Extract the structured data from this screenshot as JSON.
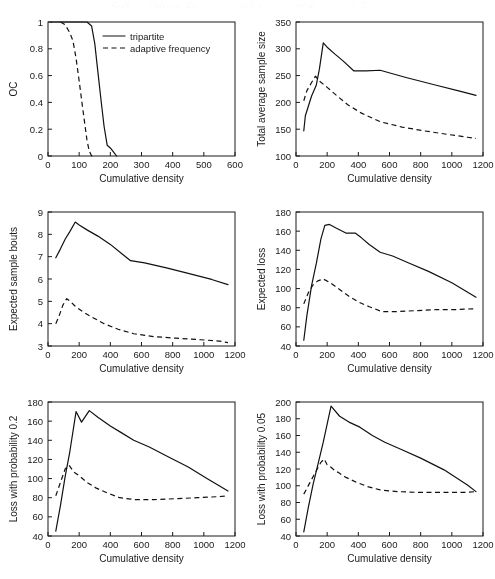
{
  "figure": {
    "title": "",
    "panel_count": 6,
    "legend": {
      "entries": [
        {
          "label": "tripartite",
          "style": "solid"
        },
        {
          "label": "adaptive frequency",
          "style": "dashed"
        }
      ]
    }
  },
  "chart_data": [
    {
      "id": "oc",
      "type": "line",
      "title": "",
      "xlabel": "Cumulative density",
      "ylabel": "OC",
      "xlim": [
        0,
        600
      ],
      "ylim": [
        0,
        1
      ],
      "xticks": [
        0,
        100,
        200,
        300,
        400,
        500,
        600
      ],
      "yticks": [
        0,
        0.2,
        0.4,
        0.6,
        0.8,
        1
      ],
      "ytick_labels": [
        "0",
        "0.2",
        "0.4",
        "0.6",
        "0.8",
        "1"
      ],
      "grid": false,
      "legend_position": "upper-center",
      "series": [
        {
          "name": "tripartite",
          "style": "solid",
          "x": [
            10,
            60,
            110,
            125,
            140,
            150,
            160,
            170,
            180,
            190,
            200,
            210,
            220
          ],
          "y": [
            1.0,
            1.0,
            1.0,
            1.0,
            0.97,
            0.84,
            0.63,
            0.42,
            0.22,
            0.08,
            0.06,
            0.03,
            0.0
          ]
        },
        {
          "name": "adaptive frequency",
          "style": "dashed",
          "x": [
            40,
            55,
            70,
            80,
            90,
            100,
            110,
            118,
            125,
            132,
            140,
            150
          ],
          "y": [
            1.0,
            0.98,
            0.92,
            0.86,
            0.73,
            0.56,
            0.38,
            0.24,
            0.12,
            0.04,
            0.0,
            0.0
          ]
        }
      ]
    },
    {
      "id": "total-average-sample-size",
      "type": "line",
      "title": "",
      "xlabel": "Cumulative density",
      "ylabel": "Total average sample size",
      "xlim": [
        0,
        1200
      ],
      "ylim": [
        100,
        350
      ],
      "xticks": [
        0,
        200,
        400,
        600,
        800,
        1000,
        1200
      ],
      "yticks": [
        100,
        150,
        200,
        250,
        300,
        350
      ],
      "grid": false,
      "series": [
        {
          "name": "tripartite",
          "style": "solid",
          "x": [
            50,
            60,
            100,
            130,
            150,
            175,
            200,
            250,
            300,
            370,
            450,
            540,
            700,
            900,
            1050,
            1155
          ],
          "y": [
            147,
            175,
            212,
            232,
            262,
            311,
            303,
            290,
            278,
            259,
            259,
            260,
            247,
            232,
            221,
            213
          ]
        },
        {
          "name": "adaptive frequency",
          "style": "dashed",
          "x": [
            50,
            70,
            100,
            125,
            150,
            200,
            260,
            330,
            420,
            540,
            680,
            820,
            980,
            1100,
            1155
          ],
          "y": [
            203,
            222,
            237,
            249,
            240,
            228,
            213,
            196,
            180,
            164,
            154,
            147,
            140,
            135,
            133
          ]
        }
      ]
    },
    {
      "id": "expected-sample-bouts",
      "type": "line",
      "title": "",
      "xlabel": "Cumulative density",
      "ylabel": "Expected sample bouts",
      "xlim": [
        0,
        1200
      ],
      "ylim": [
        3,
        9
      ],
      "xticks": [
        0,
        200,
        400,
        600,
        800,
        1000,
        1200
      ],
      "yticks": [
        3,
        4,
        5,
        6,
        7,
        8,
        9
      ],
      "grid": false,
      "series": [
        {
          "name": "tripartite",
          "style": "solid",
          "x": [
            50,
            80,
            110,
            140,
            175,
            200,
            250,
            320,
            400,
            470,
            530,
            620,
            760,
            900,
            1050,
            1155
          ],
          "y": [
            6.95,
            7.35,
            7.78,
            8.12,
            8.55,
            8.42,
            8.2,
            7.92,
            7.55,
            7.15,
            6.82,
            6.72,
            6.5,
            6.25,
            5.98,
            5.75
          ]
        },
        {
          "name": "adaptive frequency",
          "style": "dashed",
          "x": [
            50,
            70,
            95,
            120,
            140,
            175,
            220,
            280,
            360,
            450,
            550,
            680,
            820,
            980,
            1100,
            1155
          ],
          "y": [
            4.0,
            4.32,
            4.82,
            5.12,
            5.02,
            4.78,
            4.55,
            4.3,
            4.0,
            3.75,
            3.55,
            3.42,
            3.35,
            3.28,
            3.22,
            3.15
          ]
        }
      ]
    },
    {
      "id": "expected-loss",
      "type": "line",
      "title": "",
      "xlabel": "Cumulative density",
      "ylabel": "Expected loss",
      "xlim": [
        0,
        1200
      ],
      "ylim": [
        40,
        180
      ],
      "xticks": [
        0,
        200,
        400,
        600,
        800,
        1000,
        1200
      ],
      "yticks": [
        40,
        60,
        80,
        100,
        120,
        140,
        160,
        180
      ],
      "grid": false,
      "series": [
        {
          "name": "tripartite",
          "style": "solid",
          "x": [
            50,
            70,
            100,
            130,
            160,
            185,
            215,
            260,
            320,
            380,
            420,
            470,
            540,
            620,
            720,
            850,
            1000,
            1155
          ],
          "y": [
            46,
            72,
            103,
            126,
            152,
            166,
            167,
            163,
            158,
            158,
            153,
            146,
            138,
            134,
            127,
            118,
            106,
            91
          ]
        },
        {
          "name": "adaptive frequency",
          "style": "dashed",
          "x": [
            50,
            80,
            110,
            140,
            175,
            220,
            280,
            340,
            400,
            470,
            550,
            650,
            780,
            900,
            1020,
            1155
          ],
          "y": [
            84,
            96,
            104,
            108,
            110,
            106,
            99,
            92,
            86,
            81,
            76,
            76,
            77,
            78,
            78,
            79
          ]
        }
      ]
    },
    {
      "id": "loss-probability-0-2",
      "type": "line",
      "title": "",
      "xlabel": "Cumulative density",
      "ylabel": "Loss with probability 0.2",
      "xlim": [
        0,
        1200
      ],
      "ylim": [
        40,
        180
      ],
      "xticks": [
        0,
        200,
        400,
        600,
        800,
        1000,
        1200
      ],
      "yticks": [
        40,
        60,
        80,
        100,
        120,
        140,
        160,
        180
      ],
      "grid": false,
      "series": [
        {
          "name": "tripartite",
          "style": "solid",
          "x": [
            50,
            80,
            110,
            140,
            180,
            215,
            265,
            320,
            400,
            470,
            550,
            650,
            780,
            900,
            1020,
            1155
          ],
          "y": [
            45,
            72,
            102,
            128,
            170,
            159,
            171,
            164,
            155,
            148,
            140,
            133,
            122,
            112,
            100,
            87
          ]
        },
        {
          "name": "adaptive frequency",
          "style": "dashed",
          "x": [
            50,
            80,
            110,
            135,
            165,
            200,
            250,
            310,
            380,
            460,
            560,
            680,
            820,
            960,
            1080,
            1155
          ],
          "y": [
            82,
            96,
            110,
            114,
            107,
            103,
            96,
            90,
            85,
            80,
            78,
            78,
            79,
            80,
            81,
            82
          ]
        }
      ]
    },
    {
      "id": "loss-probability-0-05",
      "type": "line",
      "title": "",
      "xlabel": "Cumulative density",
      "ylabel": "Loss with probability 0.05",
      "xlim": [
        0,
        1200
      ],
      "ylim": [
        40,
        200
      ],
      "xticks": [
        0,
        200,
        400,
        600,
        800,
        1000,
        1200
      ],
      "yticks": [
        40,
        60,
        80,
        100,
        120,
        140,
        160,
        180,
        200
      ],
      "grid": false,
      "series": [
        {
          "name": "tripartite",
          "style": "solid",
          "x": [
            50,
            80,
            110,
            140,
            175,
            205,
            225,
            280,
            340,
            410,
            490,
            570,
            680,
            800,
            950,
            1100,
            1155
          ],
          "y": [
            45,
            75,
            102,
            125,
            152,
            178,
            195,
            183,
            176,
            170,
            160,
            152,
            143,
            133,
            119,
            101,
            93
          ]
        },
        {
          "name": "adaptive frequency",
          "style": "dashed",
          "x": [
            50,
            90,
            130,
            160,
            180,
            200,
            225,
            250,
            270,
            320,
            390,
            460,
            540,
            650,
            800,
            950,
            1080,
            1155
          ],
          "y": [
            90,
            104,
            118,
            128,
            132,
            125,
            122,
            118,
            116,
            110,
            104,
            99,
            95,
            93,
            92,
            92,
            92,
            93
          ]
        }
      ]
    }
  ]
}
